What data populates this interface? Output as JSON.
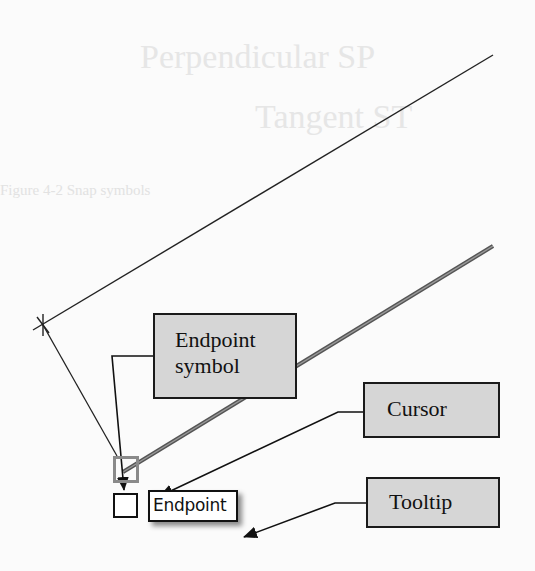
{
  "figure": {
    "callouts": {
      "endpoint_symbol": {
        "line1": "Endpoint",
        "line2": "symbol"
      },
      "cursor": {
        "label": "Cursor"
      },
      "tooltip": {
        "label": "Tooltip"
      }
    },
    "snap_tooltip": {
      "label": "Endpoint"
    },
    "icons": {
      "snap_marker": "endpoint-snap-square",
      "cursor": "pickbox-cursor-square",
      "vertex": "x-vertex-marker"
    },
    "colors": {
      "callout_fill": "#d6d6d6",
      "callout_border": "#1a1a1a",
      "snap_marker": "#8a8a8a",
      "line": "#222222",
      "background": "#fbfbfb"
    }
  },
  "background_bleed": {
    "line1": "Perpendicular     SP",
    "line2": "Tangent           ST",
    "caption": "Figure 4-2 Snap symbols"
  }
}
